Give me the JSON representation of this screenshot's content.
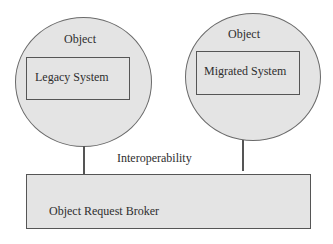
{
  "diagram": {
    "objects": [
      {
        "title": "Object",
        "component": "Legacy System"
      },
      {
        "title": "Object",
        "component": "Migrated System"
      }
    ],
    "connector_label": "Interoperability",
    "broker": {
      "label": "Object Request Broker"
    }
  }
}
